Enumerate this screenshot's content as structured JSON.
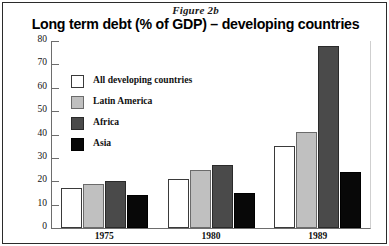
{
  "figure": {
    "label": "Figure 2b",
    "title": "Long term debt (% of GDP) – developing countries"
  },
  "legend": {
    "position": "inside-top-left",
    "entries": [
      {
        "label": "All developing countries",
        "color": "#ffffff"
      },
      {
        "label": "Latin America",
        "color": "#c0c0c0"
      },
      {
        "label": "Africa",
        "color": "#4a4a4a"
      },
      {
        "label": "Asia",
        "color": "#080808"
      }
    ]
  },
  "axis": {
    "y_ticks": [
      "80",
      "70",
      "60",
      "50",
      "40",
      "30",
      "20",
      "10",
      "0"
    ],
    "x_labels": [
      "1975",
      "1980",
      "1989"
    ]
  },
  "chart_data": {
    "type": "bar",
    "title": "Long term debt (% of GDP) – developing countries",
    "subtitle": "Figure 2b",
    "xlabel": "",
    "ylabel": "",
    "ylim": [
      0,
      80
    ],
    "ytick_step": 10,
    "grid": false,
    "legend_position": "inside-top-left",
    "categories": [
      "1975",
      "1980",
      "1989"
    ],
    "series": [
      {
        "name": "All developing countries",
        "color": "#ffffff",
        "values": [
          17,
          21,
          35
        ]
      },
      {
        "name": "Latin America",
        "color": "#c0c0c0",
        "values": [
          19,
          25,
          41
        ]
      },
      {
        "name": "Africa",
        "color": "#4a4a4a",
        "values": [
          20,
          27,
          78
        ]
      },
      {
        "name": "Asia",
        "color": "#080808",
        "values": [
          14,
          15,
          24
        ]
      }
    ]
  }
}
